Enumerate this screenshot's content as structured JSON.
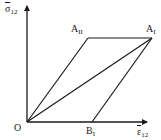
{
  "diagram": {
    "type": "stress-strain parallelogram",
    "axes": {
      "y_label": {
        "symbol": "σ",
        "subscript": "12",
        "overbar": true
      },
      "x_label": {
        "symbol": "ε",
        "subscript": "12",
        "overbar": true
      },
      "origin_label": "O"
    },
    "points": {
      "O": {
        "label": "O",
        "sub": "",
        "x": 27,
        "y": 122
      },
      "AII": {
        "label": "A",
        "sub": "II",
        "x": 88,
        "y": 38
      },
      "AI": {
        "label": "A",
        "sub": "I",
        "x": 152,
        "y": 38
      },
      "BI": {
        "label": "B",
        "sub": "I",
        "x": 92,
        "y": 122
      }
    },
    "edges": [
      [
        "O",
        "AII"
      ],
      [
        "AII",
        "AI"
      ],
      [
        "O",
        "AI"
      ],
      [
        "BI",
        "AI"
      ],
      [
        "O",
        "BI"
      ]
    ],
    "line_color": "#1a1a1a"
  }
}
